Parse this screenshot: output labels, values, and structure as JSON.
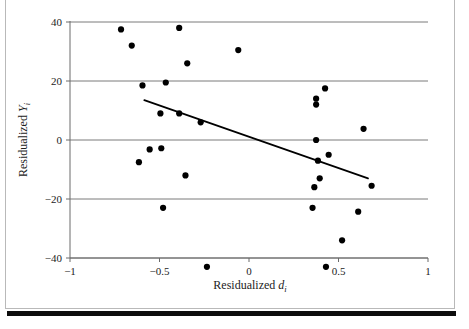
{
  "figure": {
    "background_color": "#ffffff",
    "frame_color": "#b9b9b9",
    "rule_color": "#0d0d0d",
    "point_color": "#000000",
    "gridline_color": "#7a7a7a",
    "axis_color": "#6b6b6b",
    "trendline_color": "#000000"
  },
  "chart_data": {
    "type": "scatter",
    "title": "",
    "xlabel": "Residualized d_i",
    "ylabel": "Residualized Y_i",
    "xlabel_parts": {
      "prefix": "Residualized ",
      "variable": "d",
      "subscript": "i"
    },
    "ylabel_parts": {
      "prefix": "Residualized ",
      "variable": "Y",
      "subscript": "i"
    },
    "xlim": [
      -1,
      1
    ],
    "ylim": [
      -47,
      43
    ],
    "xticks": [
      -1,
      -0.5,
      0,
      0.5,
      1
    ],
    "xtick_labels": [
      "−1",
      "−0.5",
      "0",
      "0.5",
      "1"
    ],
    "yticks": [
      -40,
      -20,
      0,
      20,
      40
    ],
    "ytick_labels": [
      "−40",
      "−20",
      "0",
      "20",
      "40"
    ],
    "grid": "horizontal",
    "legend": "none",
    "points": [
      {
        "x": -0.715,
        "y": 37.5
      },
      {
        "x": -0.655,
        "y": 32.0
      },
      {
        "x": -0.39,
        "y": 38.0
      },
      {
        "x": -0.345,
        "y": 26.0
      },
      {
        "x": -0.06,
        "y": 30.5
      },
      {
        "x": -0.595,
        "y": 18.5
      },
      {
        "x": -0.465,
        "y": 19.5
      },
      {
        "x": -0.495,
        "y": 9.0
      },
      {
        "x": -0.39,
        "y": 9.0
      },
      {
        "x": -0.27,
        "y": 6.0
      },
      {
        "x": -0.555,
        "y": -3.2
      },
      {
        "x": -0.49,
        "y": -2.8
      },
      {
        "x": -0.615,
        "y": -7.5
      },
      {
        "x": -0.355,
        "y": -12.0
      },
      {
        "x": -0.48,
        "y": -23.0
      },
      {
        "x": -0.235,
        "y": -43.0
      },
      {
        "x": 0.375,
        "y": 14.0
      },
      {
        "x": 0.375,
        "y": 12.0
      },
      {
        "x": 0.425,
        "y": 17.5
      },
      {
        "x": 0.64,
        "y": 3.8
      },
      {
        "x": 0.375,
        "y": 0.0
      },
      {
        "x": 0.385,
        "y": -7.0
      },
      {
        "x": 0.445,
        "y": -5.0
      },
      {
        "x": 0.395,
        "y": -13.0
      },
      {
        "x": 0.365,
        "y": -16.0
      },
      {
        "x": 0.685,
        "y": -15.5
      },
      {
        "x": 0.355,
        "y": -23.0
      },
      {
        "x": 0.61,
        "y": -24.3
      },
      {
        "x": 0.52,
        "y": -34.0
      },
      {
        "x": 0.43,
        "y": -43.0
      }
    ],
    "trendline": {
      "x_start": -0.585,
      "y_start": 13.5,
      "x_end": 0.665,
      "y_end": -13.0,
      "slope": -21.2,
      "intercept": 1.1
    }
  }
}
